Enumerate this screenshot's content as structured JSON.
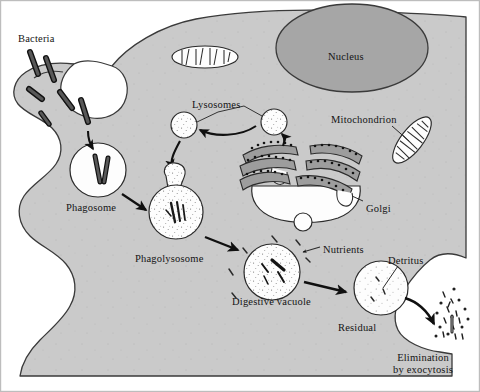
{
  "figure": {
    "type": "biological-cell-diagram",
    "frame": {
      "border_color": "#b4b4b4",
      "background": "#ffffff"
    }
  },
  "colors": {
    "cytoplasm": "#cacaca",
    "cytoplasm_edge": "#3a3a3a",
    "nucleus": "#a6a6a6",
    "nucleus_edge": "#3a3a3a",
    "organelle_fill": "#fdfdfd",
    "organelle_edge": "#2b2b2b",
    "golgi_cisterna": "#9d9d9d",
    "bacteria_fill": "#585858",
    "bacteria_edge": "#111111",
    "arrow": "#101010",
    "text": "#141414",
    "stipple": "#6d6d6d"
  },
  "labels": [
    {
      "name": "bacteria",
      "text": "Bacteria",
      "x": 18,
      "y": 33,
      "align": "left"
    },
    {
      "name": "nucleus",
      "text": "Nucleus",
      "x": 328,
      "y": 51,
      "align": "left"
    },
    {
      "name": "lysosomes",
      "text": "Lysosomes",
      "x": 192,
      "y": 99,
      "align": "left"
    },
    {
      "name": "mitochondrion",
      "text": "Mitochondrion",
      "x": 331,
      "y": 114,
      "align": "left"
    },
    {
      "name": "phagosome",
      "text": "Phagosome",
      "x": 66,
      "y": 202,
      "align": "left"
    },
    {
      "name": "golgi",
      "text": "Golgi",
      "x": 366,
      "y": 203,
      "align": "left"
    },
    {
      "name": "phagolysosome",
      "text": "Phagolysosome",
      "x": 135,
      "y": 253,
      "align": "left"
    },
    {
      "name": "nutrients",
      "text": "Nutrients",
      "x": 323,
      "y": 244,
      "align": "left"
    },
    {
      "name": "detritus",
      "text": "Detritus",
      "x": 388,
      "y": 255,
      "align": "left"
    },
    {
      "name": "digestive-vacuole",
      "text": "Digestive vacuole",
      "x": 232,
      "y": 296,
      "align": "left"
    },
    {
      "name": "residual",
      "text": "Residual",
      "x": 338,
      "y": 322,
      "align": "left"
    }
  ],
  "multiline_labels": [
    {
      "name": "elimination-by-exocytosis",
      "line1": "Elimination",
      "line2": "by exocytosis",
      "x": 393,
      "y": 352
    }
  ],
  "structures": {
    "cell": {
      "name": "cell-body",
      "description": "irregular amoeboid cell outline filling most of frame"
    },
    "nucleus": {
      "name": "nucleus",
      "cx": 352,
      "cy": 48,
      "rx": 76,
      "ry": 44
    },
    "mitochondria": [
      {
        "name": "mitochondrion-upper",
        "cx": 205,
        "cy": 57,
        "rx": 33,
        "ry": 11,
        "rotation": 0,
        "cristae": 7
      },
      {
        "name": "mitochondrion-labeled",
        "cx": 412,
        "cy": 140,
        "rx": 28,
        "ry": 11,
        "rotation": -52,
        "cristae": 8
      }
    ],
    "lysosomes": [
      {
        "name": "lysosome-left",
        "cx": 184,
        "cy": 125,
        "r": 13
      },
      {
        "name": "lysosome-right",
        "cx": 274,
        "cy": 122,
        "r": 13
      },
      {
        "name": "lysosome-fusing",
        "cx": 176,
        "cy": 181,
        "r": 11
      }
    ],
    "golgi": {
      "name": "golgi-apparatus",
      "cx": 303,
      "cy": 180,
      "cisternae": 5,
      "vesicle_below": true
    },
    "vacuoles": [
      {
        "name": "phagosome",
        "cx": 98,
        "cy": 170,
        "r": 27,
        "contents": "bacteria",
        "stipple": false
      },
      {
        "name": "phagolysosome",
        "cx": 176,
        "cy": 208,
        "r": 27,
        "contents": "bacteria",
        "stipple": true
      },
      {
        "name": "digestive-vacuole",
        "cx": 272,
        "cy": 272,
        "r": 28,
        "contents": "fragments",
        "stipple": true
      },
      {
        "name": "residual-body",
        "cx": 381,
        "cy": 288,
        "r": 27,
        "contents": "detritus",
        "stipple": true
      }
    ],
    "bacteria_outside": 6,
    "exocytosis_debris": {
      "name": "exocytosis-debris",
      "x": 437,
      "y": 310,
      "count": 42
    }
  },
  "arrows": [
    {
      "name": "arrow-engulf-to-phagosome",
      "from": "engulfment-pocket",
      "to": "phagosome"
    },
    {
      "name": "arrow-lysosome-pair",
      "from": "lysosome-right",
      "to": "lysosome-left"
    },
    {
      "name": "arrow-lysosome-to-phagolysosome",
      "from": "lysosome-left",
      "to": "lysosome-fusing"
    },
    {
      "name": "arrow-golgi-to-lysosome",
      "from": "golgi",
      "to": "lysosome-right"
    },
    {
      "name": "arrow-phagosome-to-phagolysosome",
      "from": "phagosome",
      "to": "phagolysosome"
    },
    {
      "name": "arrow-phagolysosome-to-digestive",
      "from": "phagolysosome",
      "to": "digestive-vacuole"
    },
    {
      "name": "arrow-digestive-to-residual",
      "from": "digestive-vacuole",
      "to": "residual-body"
    },
    {
      "name": "arrow-residual-to-exocytosis",
      "from": "residual-body",
      "to": "exocytosis-debris"
    },
    {
      "name": "leader-nutrients",
      "from": "nutrients-label",
      "to": "cytoplasm-nutrients"
    },
    {
      "name": "leader-detritus",
      "from": "detritus-label",
      "to": "residual-body"
    },
    {
      "name": "leader-mitochondrion",
      "from": "mitochondrion-label",
      "to": "mitochondrion-labeled"
    },
    {
      "name": "leader-golgi",
      "from": "golgi-label",
      "to": "golgi-apparatus"
    },
    {
      "name": "leader-lysosomes",
      "from": "lysosomes-label",
      "to": "lysosome-left-and-right"
    }
  ]
}
